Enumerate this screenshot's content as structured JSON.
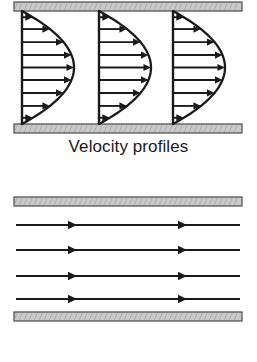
{
  "figure": {
    "width": 257,
    "height": 362,
    "background": "#ffffff",
    "ink_color": "#1a1a1a",
    "wall_fill": "#c9c9c9",
    "wall_stroke": "#4a4a4a"
  },
  "panels": [
    {
      "id": "velocity-profiles",
      "caption": "Velocity profiles",
      "walls": {
        "top": {
          "x": 14,
          "y": 2,
          "width": 228,
          "height": 9
        },
        "bottom": {
          "x": 14,
          "y": 124,
          "width": 228,
          "height": 9
        }
      },
      "profiles": [
        {
          "baseline_x": 22,
          "max_bulge": 52,
          "arrow_count": 9
        },
        {
          "baseline_x": 99,
          "max_bulge": 52,
          "arrow_count": 9
        },
        {
          "baseline_x": 173,
          "max_bulge": 52,
          "arrow_count": 9
        }
      ],
      "channel": {
        "top_y": 11,
        "bottom_y": 124
      },
      "arrow_rows": [
        0.055,
        0.16,
        0.275,
        0.39,
        0.5,
        0.61,
        0.725,
        0.84,
        0.945
      ],
      "profile_shape": "parabolic"
    },
    {
      "id": "streamlines",
      "caption": "Streamlines",
      "walls": {
        "top": {
          "x": 14,
          "y": 11,
          "width": 228,
          "height": 9
        },
        "bottom": {
          "x": 14,
          "y": 126,
          "width": 228,
          "height": 9
        }
      },
      "lines": [
        {
          "y": 39,
          "x_start": 16,
          "x_end": 240,
          "arrow_positions": [
            68,
            178
          ]
        },
        {
          "y": 64,
          "x_start": 16,
          "x_end": 240,
          "arrow_positions": [
            68,
            178
          ]
        },
        {
          "y": 90,
          "x_start": 16,
          "x_end": 240,
          "arrow_positions": [
            68,
            178
          ]
        },
        {
          "y": 113,
          "x_start": 16,
          "x_end": 240,
          "arrow_positions": [
            68,
            178
          ]
        }
      ],
      "arrow_count_per_line": 2,
      "line_count": 4
    }
  ],
  "chart_data": {
    "type": "line",
    "subcharts": [
      {
        "name": "Velocity profiles",
        "description": "Three identical fully-developed parabolic velocity profiles between two parallel plates",
        "profile_equation": "u(y) = u_max * (1 - (2y/h - 1)^2)",
        "profiles": 3,
        "vectors_per_profile": 9,
        "normalized_y": [
          0.055,
          0.16,
          0.275,
          0.39,
          0.5,
          0.61,
          0.725,
          0.84,
          0.945
        ],
        "normalized_u": [
          0.21,
          0.54,
          0.8,
          0.95,
          1.0,
          0.96,
          0.8,
          0.54,
          0.21
        ],
        "no_slip_at_walls": true
      },
      {
        "name": "Streamlines",
        "description": "Four straight horizontal streamlines parallel to the channel walls",
        "streamlines": 4,
        "arrowheads_per_streamline": 2,
        "direction": "left-to-right"
      }
    ],
    "xlabel": "",
    "ylabel": "",
    "grid": false,
    "legend": "none"
  }
}
